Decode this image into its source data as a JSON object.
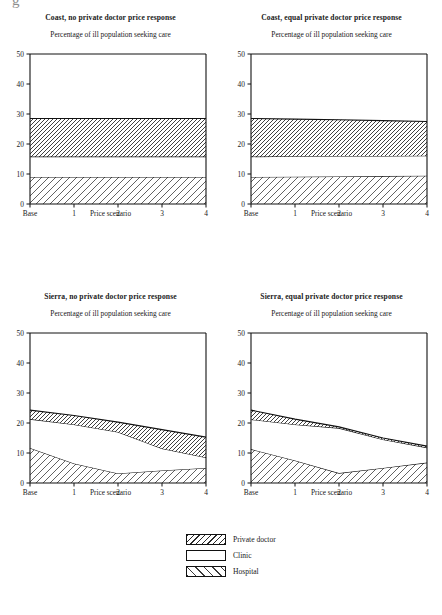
{
  "figure": {
    "scan_artifact": "g",
    "axis_caption": "Price scenario",
    "subtitle": "Percentage of ill population seeking care"
  },
  "legend": {
    "items": [
      {
        "label": "Private doctor",
        "pattern": "dense-backslash-hatch"
      },
      {
        "label": "Clinic",
        "pattern": "none"
      },
      {
        "label": "Hospital",
        "pattern": "sparse-slash-hatch"
      }
    ]
  },
  "panels": [
    {
      "id": "coast-no-response",
      "title": "Coast, no private doctor price response"
    },
    {
      "id": "coast-equal-response",
      "title": "Coast, equal private doctor price response"
    },
    {
      "id": "sierra-no-response",
      "title": "Sierra, no private doctor price response"
    },
    {
      "id": "sierra-equal-response",
      "title": "Sierra, equal private doctor price response"
    }
  ],
  "chart_data": [
    {
      "id": "coast-no-response",
      "type": "area",
      "title": "Coast, no private doctor price response",
      "subtitle": "Percentage of ill population seeking care",
      "xlabel": "Price scenario",
      "ylabel": "",
      "categories": [
        "Base",
        "1",
        "2",
        "3",
        "4"
      ],
      "xticklabels": [
        "Base",
        "1",
        "2",
        "3",
        "4"
      ],
      "yticklabels": [
        "0",
        "10",
        "20",
        "30",
        "40",
        "50"
      ],
      "ylim": [
        0,
        50
      ],
      "ytick_interval": 10,
      "grid": false,
      "stacked": true,
      "legend_position": "below-figure",
      "series": [
        {
          "name": "Hospital",
          "pattern": "sparse-slash-hatch",
          "values": [
            9.0,
            9.0,
            9.0,
            9.0,
            9.0
          ]
        },
        {
          "name": "Clinic",
          "pattern": "none",
          "values": [
            6.8,
            6.8,
            6.8,
            6.8,
            6.8
          ]
        },
        {
          "name": "Private doctor",
          "pattern": "dense-backslash-hatch",
          "values": [
            12.7,
            12.7,
            12.7,
            12.7,
            12.7
          ]
        }
      ],
      "cumulative_tops": {
        "Hospital": [
          9.0,
          9.0,
          9.0,
          9.0,
          9.0
        ],
        "Clinic": [
          15.8,
          15.8,
          15.8,
          15.8,
          15.8
        ],
        "Private doctor": [
          28.5,
          28.5,
          28.5,
          28.5,
          28.5
        ]
      }
    },
    {
      "id": "coast-equal-response",
      "type": "area",
      "title": "Coast, equal private doctor price response",
      "subtitle": "Percentage of ill population seeking care",
      "xlabel": "Price scenario",
      "ylabel": "",
      "categories": [
        "Base",
        "1",
        "2",
        "3",
        "4"
      ],
      "xticklabels": [
        "Base",
        "1",
        "2",
        "3",
        "4"
      ],
      "yticklabels": [
        "0",
        "10",
        "20",
        "30",
        "40",
        "50"
      ],
      "ylim": [
        0,
        50
      ],
      "ytick_interval": 10,
      "grid": false,
      "stacked": true,
      "legend_position": "below-figure",
      "series": [
        {
          "name": "Hospital",
          "pattern": "sparse-slash-hatch",
          "values": [
            9.0,
            9.1,
            9.2,
            9.3,
            9.4
          ]
        },
        {
          "name": "Clinic",
          "pattern": "none",
          "values": [
            6.8,
            6.8,
            6.8,
            6.7,
            6.7
          ]
        },
        {
          "name": "Private doctor",
          "pattern": "dense-backslash-hatch",
          "values": [
            12.7,
            12.4,
            12.1,
            11.8,
            11.4
          ]
        }
      ],
      "cumulative_tops": {
        "Hospital": [
          9.0,
          9.1,
          9.2,
          9.3,
          9.4
        ],
        "Clinic": [
          15.8,
          15.9,
          16.0,
          16.0,
          16.1
        ],
        "Private doctor": [
          28.5,
          28.3,
          28.1,
          27.8,
          27.5
        ]
      }
    },
    {
      "id": "sierra-no-response",
      "type": "area",
      "title": "Sierra, no private doctor price response",
      "subtitle": "Percentage of ill population seeking care",
      "xlabel": "Price scenario",
      "ylabel": "",
      "categories": [
        "Base",
        "1",
        "2",
        "3",
        "4"
      ],
      "xticklabels": [
        "Base",
        "1",
        "2",
        "3",
        "4"
      ],
      "yticklabels": [
        "0",
        "10",
        "20",
        "30",
        "40",
        "50"
      ],
      "ylim": [
        0,
        50
      ],
      "ytick_interval": 10,
      "grid": false,
      "stacked": true,
      "legend_position": "below-figure",
      "series": [
        {
          "name": "Hospital",
          "pattern": "sparse-slash-hatch",
          "values": [
            11.7,
            6.5,
            3.2,
            4.2,
            5.0
          ]
        },
        {
          "name": "Clinic",
          "pattern": "none",
          "values": [
            9.6,
            13.0,
            13.8,
            7.3,
            3.5
          ]
        },
        {
          "name": "Private doctor",
          "pattern": "dense-backslash-hatch",
          "values": [
            3.0,
            3.0,
            3.3,
            6.3,
            6.8
          ]
        }
      ],
      "cumulative_tops": {
        "Hospital": [
          11.7,
          6.5,
          3.2,
          4.2,
          5.0
        ],
        "Clinic": [
          21.3,
          19.5,
          17.0,
          11.5,
          8.5
        ],
        "Private doctor": [
          24.3,
          22.5,
          20.3,
          17.8,
          15.3
        ]
      }
    },
    {
      "id": "sierra-equal-response",
      "type": "area",
      "title": "Sierra, equal private doctor price response",
      "subtitle": "Percentage of ill population seeking care",
      "xlabel": "Price scenario",
      "ylabel": "",
      "categories": [
        "Base",
        "1",
        "2",
        "3",
        "4"
      ],
      "xticklabels": [
        "Base",
        "1",
        "2",
        "3",
        "4"
      ],
      "yticklabels": [
        "0",
        "10",
        "20",
        "30",
        "40",
        "50"
      ],
      "ylim": [
        0,
        50
      ],
      "ytick_interval": 10,
      "grid": false,
      "stacked": true,
      "legend_position": "below-figure",
      "series": [
        {
          "name": "Hospital",
          "pattern": "sparse-slash-hatch",
          "values": [
            11.3,
            7.5,
            3.3,
            5.0,
            6.8
          ]
        },
        {
          "name": "Clinic",
          "pattern": "none",
          "values": [
            9.9,
            12.0,
            15.0,
            9.5,
            5.0
          ]
        },
        {
          "name": "Private doctor",
          "pattern": "dense-backslash-hatch",
          "values": [
            3.1,
            1.8,
            0.4,
            0.5,
            0.5
          ]
        }
      ],
      "cumulative_tops": {
        "Hospital": [
          11.3,
          7.5,
          3.3,
          5.0,
          6.8
        ],
        "Clinic": [
          21.2,
          19.5,
          18.3,
          14.5,
          11.8
        ],
        "Private doctor": [
          24.3,
          21.3,
          18.7,
          15.0,
          12.3
        ]
      }
    }
  ]
}
